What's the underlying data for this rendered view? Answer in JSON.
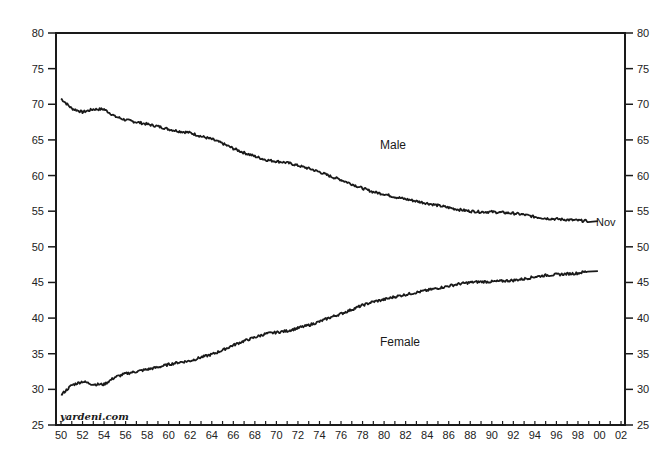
{
  "chart_data": {
    "type": "line",
    "title": "",
    "xlabel": "",
    "ylabel": "",
    "ylim": [
      25,
      80
    ],
    "xlim": [
      1950,
      2002
    ],
    "grid": false,
    "y_ticks": [
      25,
      30,
      35,
      40,
      45,
      50,
      55,
      60,
      65,
      70,
      75,
      80
    ],
    "x_tick_labels": [
      "50",
      "52",
      "54",
      "56",
      "58",
      "60",
      "62",
      "64",
      "66",
      "68",
      "70",
      "72",
      "74",
      "76",
      "78",
      "80",
      "82",
      "84",
      "86",
      "88",
      "90",
      "92",
      "94",
      "96",
      "98",
      "00",
      "02"
    ],
    "x": [
      1950,
      1951,
      1952,
      1953,
      1954,
      1955,
      1956,
      1957,
      1958,
      1959,
      1960,
      1961,
      1962,
      1963,
      1964,
      1965,
      1966,
      1967,
      1968,
      1969,
      1970,
      1971,
      1972,
      1973,
      1974,
      1975,
      1976,
      1977,
      1978,
      1979,
      1980,
      1981,
      1982,
      1983,
      1984,
      1985,
      1986,
      1987,
      1988,
      1989,
      1990,
      1991,
      1992,
      1993,
      1994,
      1995,
      1996,
      1997,
      1998,
      1999
    ],
    "series": [
      {
        "name": "Male",
        "values": [
          70.8,
          69.4,
          68.9,
          69.3,
          69.3,
          68.3,
          67.8,
          67.5,
          67.2,
          66.9,
          66.5,
          66.2,
          66.0,
          65.5,
          65.1,
          64.5,
          63.8,
          63.2,
          62.7,
          62.2,
          62.0,
          61.8,
          61.4,
          61.0,
          60.5,
          59.9,
          59.4,
          58.8,
          58.2,
          57.7,
          57.4,
          57.0,
          56.7,
          56.4,
          56.1,
          55.8,
          55.5,
          55.2,
          55.0,
          54.9,
          54.9,
          54.8,
          54.7,
          54.5,
          54.2,
          54.0,
          53.9,
          53.8,
          53.7,
          53.6
        ]
      },
      {
        "name": "Female",
        "values": [
          29.2,
          30.6,
          31.1,
          30.7,
          30.7,
          31.7,
          32.2,
          32.5,
          32.8,
          33.1,
          33.5,
          33.8,
          34.0,
          34.5,
          34.9,
          35.5,
          36.2,
          36.8,
          37.3,
          37.8,
          38.0,
          38.2,
          38.6,
          39.0,
          39.5,
          40.1,
          40.6,
          41.2,
          41.8,
          42.3,
          42.6,
          43.0,
          43.3,
          43.6,
          43.9,
          44.2,
          44.5,
          44.8,
          45.0,
          45.1,
          45.1,
          45.2,
          45.3,
          45.5,
          45.8,
          46.0,
          46.1,
          46.2,
          46.3,
          46.6
        ]
      }
    ],
    "annotations": [
      {
        "text": "Male",
        "year": 1981,
        "value": 64.2
      },
      {
        "text": "Female",
        "year": 1981,
        "value": 37.8
      },
      {
        "text": "Nov",
        "year": 1999.5,
        "value": 53.6
      }
    ],
    "source": "yardeni.com"
  },
  "labels": {
    "male": "Male",
    "female": "Female",
    "last_point": "Nov",
    "source": "yardeni.com"
  },
  "colors": {
    "line": "#1a1a1a",
    "axis": "#1a1a1a",
    "background": "#ffffff"
  }
}
